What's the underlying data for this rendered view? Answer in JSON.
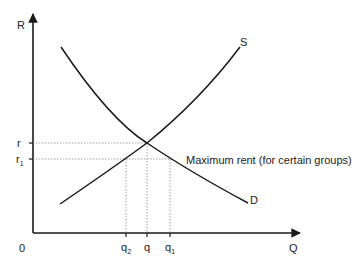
{
  "diagram": {
    "axes": {
      "y_label": "R",
      "x_label": "Q",
      "origin_label": "0"
    },
    "curves": {
      "supply_label": "S",
      "demand_label": "D"
    },
    "price_levels": {
      "r_label": "r",
      "r1_label": "r",
      "r1_sub": "1"
    },
    "quantity_levels": {
      "q2_label": "q",
      "q2_sub": "2",
      "q_label": "q",
      "q1_label": "q",
      "q1_sub": "1"
    },
    "annotation": "Maximum rent (for certain groups)",
    "colors": {
      "line": "#1a1a1a",
      "dotted": "#888888"
    }
  }
}
